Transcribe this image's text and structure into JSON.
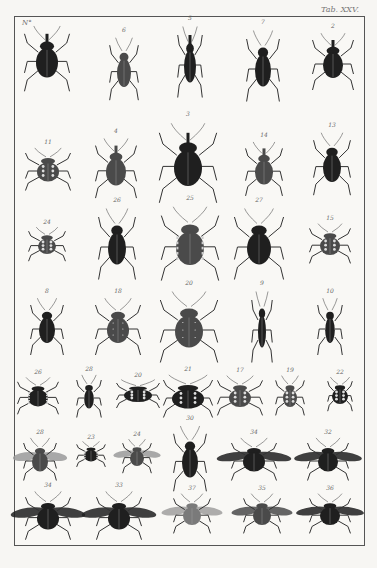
{
  "plate": {
    "label": "Tab. XXV.",
    "corner_label": "N°"
  },
  "colors": {
    "paper": "#f7f6f3",
    "ink_dark": "#1c1c1c",
    "ink_mid": "#4a4a4a",
    "frame": "#555555"
  },
  "rows": [
    {
      "specimens": [
        {
          "num": "",
          "kind": "weevil",
          "x": 47,
          "y": 55,
          "w": 22,
          "h": 46,
          "shade": "dark"
        },
        {
          "num": "6",
          "kind": "longbeetle",
          "x": 124,
          "y": 65,
          "w": 14,
          "h": 44,
          "shade": "mid"
        },
        {
          "num": "5",
          "kind": "snoutweevil",
          "x": 190,
          "y": 58,
          "w": 12,
          "h": 50,
          "shade": "dark"
        },
        {
          "num": "7",
          "kind": "longbeetle",
          "x": 263,
          "y": 62,
          "w": 16,
          "h": 50,
          "shade": "dark"
        },
        {
          "num": "2",
          "kind": "weevil",
          "x": 333,
          "y": 58,
          "w": 20,
          "h": 40,
          "shade": "dark"
        }
      ]
    },
    {
      "specimens": [
        {
          "num": "11",
          "kind": "spotted",
          "x": 48,
          "y": 165,
          "w": 22,
          "h": 30,
          "shade": "mid"
        },
        {
          "num": "4",
          "kind": "weevil",
          "x": 116,
          "y": 165,
          "w": 20,
          "h": 42,
          "shade": "mid"
        },
        {
          "num": "3",
          "kind": "weevil",
          "x": 188,
          "y": 160,
          "w": 28,
          "h": 56,
          "shade": "dark"
        },
        {
          "num": "14",
          "kind": "weevil",
          "x": 264,
          "y": 165,
          "w": 18,
          "h": 38,
          "shade": "mid"
        },
        {
          "num": "13",
          "kind": "longbeetle",
          "x": 332,
          "y": 160,
          "w": 18,
          "h": 44,
          "shade": "dark"
        }
      ]
    },
    {
      "specimens": [
        {
          "num": "24",
          "kind": "spotted",
          "x": 47,
          "y": 240,
          "w": 18,
          "h": 24,
          "shade": "mid"
        },
        {
          "num": "26",
          "kind": "ground",
          "x": 117,
          "y": 240,
          "w": 18,
          "h": 50,
          "shade": "dark"
        },
        {
          "num": "25",
          "kind": "shield",
          "x": 190,
          "y": 240,
          "w": 28,
          "h": 52,
          "shade": "mid"
        },
        {
          "num": "27",
          "kind": "longbeetle",
          "x": 259,
          "y": 240,
          "w": 24,
          "h": 50,
          "shade": "dark"
        },
        {
          "num": "15",
          "kind": "spotted",
          "x": 330,
          "y": 240,
          "w": 20,
          "h": 28,
          "shade": "mid"
        }
      ]
    },
    {
      "specimens": [
        {
          "num": "8",
          "kind": "longbeetle",
          "x": 47,
          "y": 323,
          "w": 16,
          "h": 40,
          "shade": "dark"
        },
        {
          "num": "18",
          "kind": "striated",
          "x": 118,
          "y": 323,
          "w": 22,
          "h": 40,
          "shade": "mid"
        },
        {
          "num": "20",
          "kind": "striated",
          "x": 189,
          "y": 323,
          "w": 28,
          "h": 50,
          "shade": "mid"
        },
        {
          "num": "9",
          "kind": "narrow",
          "x": 262,
          "y": 323,
          "w": 10,
          "h": 50,
          "shade": "dark"
        },
        {
          "num": "10",
          "kind": "narrow",
          "x": 330,
          "y": 323,
          "w": 12,
          "h": 40,
          "shade": "dark"
        }
      ]
    },
    {
      "specimens": [
        {
          "num": "26",
          "kind": "shield",
          "x": 38,
          "y": 392,
          "w": 20,
          "h": 26,
          "shade": "dark"
        },
        {
          "num": "28",
          "kind": "narrow",
          "x": 89,
          "y": 392,
          "w": 12,
          "h": 30,
          "shade": "dark"
        },
        {
          "num": "20",
          "kind": "ladybird",
          "x": 138,
          "y": 390,
          "w": 28,
          "h": 20,
          "shade": "dark"
        },
        {
          "num": "21",
          "kind": "ladybird",
          "x": 188,
          "y": 392,
          "w": 32,
          "h": 30,
          "shade": "dark"
        },
        {
          "num": "17",
          "kind": "spotted",
          "x": 240,
          "y": 392,
          "w": 22,
          "h": 28,
          "shade": "mid"
        },
        {
          "num": "19",
          "kind": "spotted",
          "x": 290,
          "y": 392,
          "w": 14,
          "h": 28,
          "shade": "mid"
        },
        {
          "num": "22",
          "kind": "ladybird",
          "x": 340,
          "y": 390,
          "w": 16,
          "h": 24,
          "shade": "dark"
        }
      ]
    },
    {
      "specimens": [
        {
          "num": "28",
          "kind": "fly",
          "x": 40,
          "y": 455,
          "w": 16,
          "h": 30,
          "shade": "mid"
        },
        {
          "num": "23",
          "kind": "shield",
          "x": 91,
          "y": 450,
          "w": 14,
          "h": 18,
          "shade": "dark"
        },
        {
          "num": "24",
          "kind": "fly",
          "x": 137,
          "y": 452,
          "w": 14,
          "h": 24,
          "shade": "mid"
        },
        {
          "num": "30",
          "kind": "assassin",
          "x": 190,
          "y": 455,
          "w": 16,
          "h": 46,
          "shade": "dark"
        },
        {
          "num": "34",
          "kind": "winged",
          "x": 254,
          "y": 455,
          "w": 22,
          "h": 30,
          "shade": "dark"
        },
        {
          "num": "32",
          "kind": "winged",
          "x": 328,
          "y": 455,
          "w": 20,
          "h": 30,
          "shade": "dark"
        }
      ]
    },
    {
      "specimens": [
        {
          "num": "34",
          "kind": "winged",
          "x": 48,
          "y": 512,
          "w": 22,
          "h": 34,
          "shade": "dark"
        },
        {
          "num": "33",
          "kind": "winged",
          "x": 119,
          "y": 512,
          "w": 22,
          "h": 34,
          "shade": "dark"
        },
        {
          "num": "37",
          "kind": "winged",
          "x": 192,
          "y": 510,
          "w": 18,
          "h": 28,
          "shade": "light"
        },
        {
          "num": "35",
          "kind": "winged",
          "x": 262,
          "y": 510,
          "w": 18,
          "h": 28,
          "shade": "mid"
        },
        {
          "num": "36",
          "kind": "winged",
          "x": 330,
          "y": 510,
          "w": 20,
          "h": 28,
          "shade": "dark"
        }
      ]
    }
  ]
}
